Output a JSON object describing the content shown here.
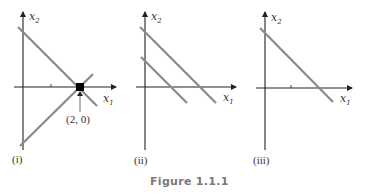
{
  "figure": {
    "caption": "Figure 1.1.1",
    "colors": {
      "axis": "#222222",
      "line": "#8a8a8a",
      "point": "#000000",
      "caption": "#7a7a7a"
    },
    "panels": [
      {
        "label": "(i)",
        "x_axis_label": "x",
        "x_axis_sub": "1",
        "y_axis_label": "x",
        "y_axis_sub": "2",
        "description": "Two lines intersecting at a single point on the x1-axis",
        "point_label": "(2, 0)"
      },
      {
        "label": "(ii)",
        "x_axis_label": "x",
        "x_axis_sub": "1",
        "y_axis_label": "x",
        "y_axis_sub": "2",
        "description": "Two parallel lines, no intersection"
      },
      {
        "label": "(iii)",
        "x_axis_label": "x",
        "x_axis_sub": "1",
        "y_axis_label": "x",
        "y_axis_sub": "2",
        "description": "Two coincident lines (single line)"
      }
    ]
  }
}
